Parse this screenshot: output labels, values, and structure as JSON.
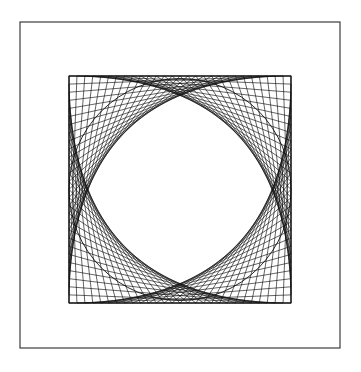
{
  "figure": {
    "type": "line-art",
    "canvas": {
      "width": 361,
      "height": 372,
      "background": "#ffffff"
    },
    "outer_frame": {
      "name": "outer-border-rectangle",
      "x": 20,
      "y": 22,
      "width": 320,
      "height": 326,
      "stroke": "#2b2b2b",
      "stroke_width": 1.1,
      "fill": "none"
    },
    "inner_square": {
      "name": "inner-square",
      "x": 69,
      "y": 76,
      "width": 222,
      "height": 227,
      "stroke": "#111111",
      "stroke_width": 1.0,
      "fill": "none"
    },
    "string_art": {
      "name": "string-art-envelope",
      "divisions": 28,
      "stroke": "#111111",
      "stroke_width": 0.65,
      "description": "Each edge of the square is divided into equal steps; point i on one edge is joined to point i on the next edge, and the family of chords envelopes the inscribed circle.",
      "corners": 4
    },
    "inscribed_circle": {
      "name": "inscribed-circle",
      "cx": 180,
      "cy": 189.5,
      "r": 111,
      "stroke": "#111111",
      "stroke_width": 0.9,
      "fill": "none"
    },
    "colors": {
      "background": "#ffffff",
      "ink": "#111111",
      "frame": "#2b2b2b"
    }
  }
}
